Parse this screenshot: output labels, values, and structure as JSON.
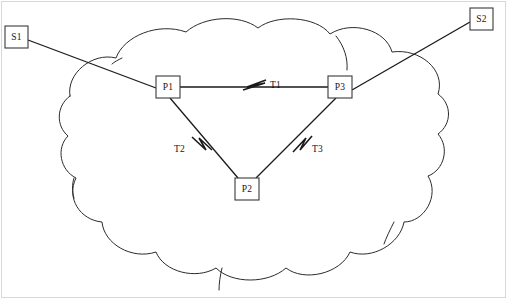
{
  "figure": {
    "kind": "network-topology-diagram",
    "background_color": "#ffffff",
    "line_color": "#1a1a1a",
    "cloud_stroke_color": "#2b2b2b",
    "frame_color": "#d8d8d8",
    "width": 507,
    "height": 299
  },
  "cloud": {
    "name": "network-cloud",
    "label": ""
  },
  "nodes": [
    {
      "id": "S1",
      "label": "S1",
      "kind": "host",
      "x": 5,
      "y": 26,
      "w": 23,
      "h": 22,
      "inside_cloud": false
    },
    {
      "id": "S2",
      "label": "S2",
      "kind": "host",
      "x": 470,
      "y": 8,
      "w": 23,
      "h": 22,
      "inside_cloud": false
    },
    {
      "id": "P1",
      "label": "P1",
      "kind": "router",
      "x": 156,
      "y": 76,
      "w": 24,
      "h": 22,
      "inside_cloud": true
    },
    {
      "id": "P2",
      "label": "P2",
      "kind": "router",
      "x": 235,
      "y": 178,
      "w": 24,
      "h": 22,
      "inside_cloud": true
    },
    {
      "id": "P3",
      "label": "P3",
      "kind": "router",
      "x": 328,
      "y": 76,
      "w": 24,
      "h": 22,
      "inside_cloud": true
    }
  ],
  "links": [
    {
      "id": "L-S1-P1",
      "from": "S1",
      "to": "P1",
      "label": "",
      "has_marker": false
    },
    {
      "id": "L-S2-P3",
      "from": "S2",
      "to": "P3",
      "label": "",
      "has_marker": false
    },
    {
      "id": "L-P1-P3",
      "from": "P1",
      "to": "P3",
      "label": "T1",
      "has_marker": true,
      "label_x": 270,
      "label_y": 88
    },
    {
      "id": "L-P1-P2",
      "from": "P1",
      "to": "P2",
      "label": "T2",
      "has_marker": true,
      "label_x": 174,
      "label_y": 152
    },
    {
      "id": "L-P3-P2",
      "from": "P3",
      "to": "P2",
      "label": "T3",
      "has_marker": true,
      "label_x": 312,
      "label_y": 152
    }
  ]
}
